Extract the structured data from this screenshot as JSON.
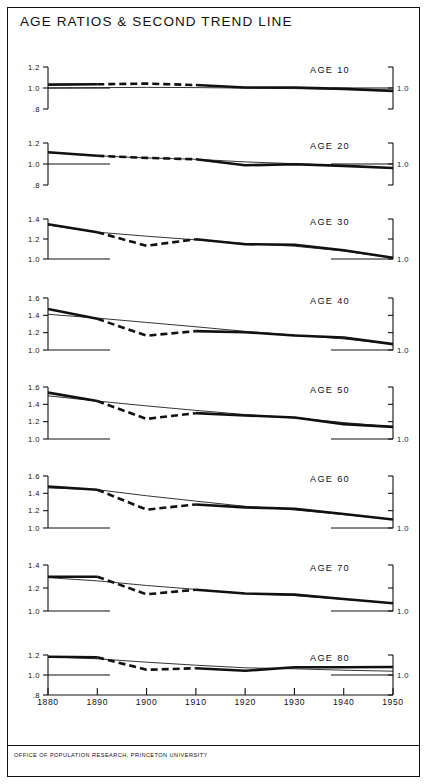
{
  "figure": {
    "title": "AGE RATIOS & SECOND TREND LINE",
    "footer": "OFFICE OF POPULATION RESEARCH, PRINCETON UNIVERSITY"
  },
  "chart_data": {
    "type": "line",
    "title": "AGE RATIOS & SECOND TREND LINE",
    "subtitle": "",
    "xlabel": "",
    "ylabel": "",
    "source": "OFFICE OF POPULATION RESEARCH, PRINCETON UNIVERSITY",
    "grid": false,
    "legend": "none",
    "x": [
      1880,
      1890,
      1900,
      1910,
      1920,
      1930,
      1940,
      1950
    ],
    "xlim": [
      1880,
      1950
    ],
    "xtick_labels": [
      "1880",
      "1890",
      "1900",
      "1910",
      "1920",
      "1930",
      "1940",
      "1950"
    ],
    "right_axis_label": "1.0",
    "panels": [
      {
        "label": "AGE 10",
        "ylim": [
          0.8,
          1.2
        ],
        "yticks": [
          0.8,
          1.0,
          1.2
        ],
        "ytick_labels": [
          ".8",
          "1.0",
          "1.2"
        ],
        "series": [
          {
            "name": "age ratio",
            "style": "thick-with-dashed-segment",
            "dash_from": 1890,
            "dash_to": 1910,
            "values": [
              1.032,
              1.035,
              1.042,
              1.028,
              1.005,
              1.005,
              0.992,
              0.972
            ]
          },
          {
            "name": "second trend line",
            "style": "thin",
            "values": [
              1.0,
              1.003,
              1.006,
              1.004,
              0.999,
              0.994,
              0.988,
              0.98
            ]
          }
        ]
      },
      {
        "label": "AGE 20",
        "ylim": [
          0.8,
          1.2
        ],
        "yticks": [
          0.8,
          1.0,
          1.2
        ],
        "ytick_labels": [
          ".8",
          "1.0",
          "1.2"
        ],
        "series": [
          {
            "name": "age ratio",
            "style": "thick-with-dashed-segment",
            "dash_from": 1890,
            "dash_to": 1910,
            "values": [
              1.112,
              1.078,
              1.058,
              1.045,
              0.988,
              0.997,
              0.982,
              0.962
            ]
          },
          {
            "name": "second trend line",
            "style": "thin",
            "values": [
              1.11,
              1.078,
              1.058,
              1.045,
              1.02,
              1.003,
              0.985,
              0.962
            ]
          }
        ]
      },
      {
        "label": "AGE 30",
        "ylim": [
          1.0,
          1.4
        ],
        "yticks": [
          1.0,
          1.2,
          1.4
        ],
        "ytick_labels": [
          "1.0",
          "1.2",
          "1.4"
        ],
        "series": [
          {
            "name": "age ratio",
            "style": "thick-with-dashed-segment",
            "dash_from": 1890,
            "dash_to": 1910,
            "values": [
              1.348,
              1.268,
              1.132,
              1.198,
              1.148,
              1.142,
              1.088,
              1.012
            ]
          },
          {
            "name": "second trend line",
            "style": "thin",
            "values": [
              1.34,
              1.268,
              1.228,
              1.192,
              1.155,
              1.128,
              1.08,
              1.012
            ]
          }
        ]
      },
      {
        "label": "AGE 40",
        "ylim": [
          1.0,
          1.6
        ],
        "yticks": [
          1.0,
          1.2,
          1.4,
          1.6
        ],
        "ytick_labels": [
          "1.0",
          "1.2",
          "1.4",
          "1.6"
        ],
        "series": [
          {
            "name": "age ratio",
            "style": "thick-with-dashed-segment",
            "dash_from": 1890,
            "dash_to": 1910,
            "values": [
              1.472,
              1.36,
              1.165,
              1.218,
              1.205,
              1.168,
              1.145,
              1.068
            ]
          },
          {
            "name": "second trend line",
            "style": "thin",
            "values": [
              1.412,
              1.368,
              1.318,
              1.268,
              1.215,
              1.172,
              1.128,
              1.068
            ]
          }
        ]
      },
      {
        "label": "AGE 50",
        "ylim": [
          1.0,
          1.6
        ],
        "yticks": [
          1.0,
          1.2,
          1.4,
          1.6
        ],
        "ytick_labels": [
          "1.0",
          "1.2",
          "1.4",
          "1.6"
        ],
        "series": [
          {
            "name": "age ratio",
            "style": "thick-with-dashed-segment",
            "dash_from": 1890,
            "dash_to": 1910,
            "values": [
              1.535,
              1.438,
              1.232,
              1.298,
              1.272,
              1.248,
              1.172,
              1.14
            ]
          },
          {
            "name": "second trend line",
            "style": "thin",
            "values": [
              1.498,
              1.438,
              1.382,
              1.33,
              1.282,
              1.242,
              1.19,
              1.14
            ]
          }
        ]
      },
      {
        "label": "AGE 60",
        "ylim": [
          1.0,
          1.6
        ],
        "yticks": [
          1.0,
          1.2,
          1.4,
          1.6
        ],
        "ytick_labels": [
          "1.0",
          "1.2",
          "1.4",
          "1.6"
        ],
        "series": [
          {
            "name": "age ratio",
            "style": "thick-with-dashed-segment",
            "dash_from": 1890,
            "dash_to": 1910,
            "values": [
              1.478,
              1.442,
              1.212,
              1.272,
              1.238,
              1.222,
              1.162,
              1.098
            ]
          },
          {
            "name": "second trend line",
            "style": "thin",
            "values": [
              1.462,
              1.442,
              1.372,
              1.31,
              1.25,
              1.208,
              1.155,
              1.098
            ]
          }
        ]
      },
      {
        "label": "AGE 70",
        "ylim": [
          1.0,
          1.4
        ],
        "yticks": [
          1.0,
          1.2,
          1.4
        ],
        "ytick_labels": [
          "1.0",
          "1.2",
          "1.4"
        ],
        "series": [
          {
            "name": "age ratio",
            "style": "thick-with-dashed-segment",
            "dash_from": 1890,
            "dash_to": 1910,
            "values": [
              1.298,
              1.298,
              1.145,
              1.185,
              1.152,
              1.142,
              1.105,
              1.068
            ]
          },
          {
            "name": "second trend line",
            "style": "thin",
            "values": [
              1.29,
              1.262,
              1.222,
              1.188,
              1.152,
              1.135,
              1.102,
              1.068
            ]
          }
        ]
      },
      {
        "label": "AGE 80",
        "ylim": [
          0.8,
          1.2
        ],
        "yticks": [
          0.8,
          1.0,
          1.2
        ],
        "ytick_labels": [
          ".8",
          "1.0",
          "1.2"
        ],
        "series": [
          {
            "name": "age ratio",
            "style": "thick-with-dashed-segment",
            "dash_from": 1890,
            "dash_to": 1910,
            "values": [
              1.182,
              1.178,
              1.052,
              1.068,
              1.042,
              1.078,
              1.078,
              1.08
            ]
          },
          {
            "name": "second trend line",
            "style": "thin",
            "values": [
              1.182,
              1.162,
              1.128,
              1.098,
              1.072,
              1.062,
              1.048,
              1.038
            ]
          }
        ]
      }
    ]
  }
}
